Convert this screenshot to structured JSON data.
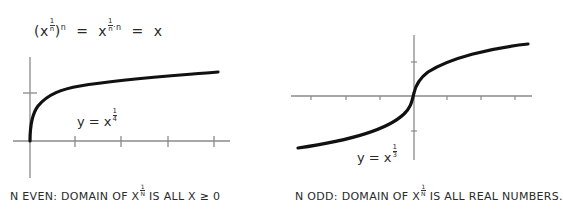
{
  "formula": {
    "lhs_base": "(x",
    "lhs_exp_num": "1",
    "lhs_exp_den": "n",
    "lhs_close": ")",
    "lhs_outer_exp": "n",
    "eq1": "=",
    "mid_base": "x",
    "mid_exp": "1/n · n",
    "mid_exp_num": "1",
    "mid_exp_den": "n",
    "mid_exp_tail": "·n",
    "eq2": "=",
    "rhs": "x"
  },
  "left_graph": {
    "label_prefix": "y = x",
    "label_exp_num": "1",
    "label_exp_den": "4",
    "caption_prefix": "n even: domain of x",
    "caption_exp_num": "1",
    "caption_exp_den": "n",
    "caption_suffix": "is all x ≥ 0"
  },
  "right_graph": {
    "label_prefix": "y = x",
    "label_exp_num": "1",
    "label_exp_den": "3",
    "caption_prefix": "n odd: domain of x",
    "caption_exp_num": "1",
    "caption_exp_den": "n",
    "caption_suffix": "is all real numbers."
  },
  "colors": {
    "axis": "#8a8a8a",
    "curve": "#111111",
    "text": "#2a2a2a"
  }
}
